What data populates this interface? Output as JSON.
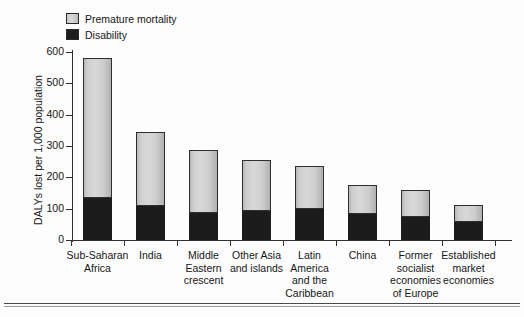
{
  "legend": {
    "items": [
      {
        "label": "Premature mortality",
        "color": "#cfcfcf",
        "swatch": "premature-mortality-swatch"
      },
      {
        "label": "Disability",
        "color": "#1c1c1c",
        "swatch": "disability-swatch"
      }
    ]
  },
  "axes": {
    "y_title": "DALYs lost per 1,000 population",
    "y_ticks": [
      "0",
      "100",
      "200",
      "300",
      "400",
      "500",
      "600"
    ],
    "x_title": ""
  },
  "chart_data": {
    "type": "bar",
    "title": "",
    "subtitle": "",
    "stacked": true,
    "xlabel": "",
    "ylabel": "DALYs lost per 1,000 population",
    "ylim": [
      0,
      600
    ],
    "ytick_step": 100,
    "grid": false,
    "legend_position": "top-left",
    "categories": [
      "Sub-Saharan Africa",
      "India",
      "Middle Eastern crescent",
      "Other Asia and islands",
      "Latin America and the Caribbean",
      "China",
      "Former socialist economies of Europe",
      "Established market economies"
    ],
    "category_label_lines": [
      [
        "Sub-Saharan",
        "Africa"
      ],
      [
        "India"
      ],
      [
        "Middle",
        "Eastern",
        "crescent"
      ],
      [
        "Other Asia",
        "and islands"
      ],
      [
        "Latin",
        "America",
        "and the",
        "Caribbean"
      ],
      [
        "China"
      ],
      [
        "Former",
        "socialist",
        "economies",
        "of Europe"
      ],
      [
        "Established",
        "market",
        "economies"
      ]
    ],
    "series": [
      {
        "name": "Disability",
        "color": "#1c1c1c",
        "values": [
          135,
          108,
          87,
          92,
          100,
          82,
          72,
          59
        ]
      },
      {
        "name": "Premature mortality",
        "color": "#cfcfcf",
        "values": [
          445,
          237,
          201,
          163,
          135,
          93,
          88,
          54
        ]
      }
    ],
    "totals": [
      580,
      345,
      288,
      255,
      235,
      175,
      160,
      113
    ]
  }
}
